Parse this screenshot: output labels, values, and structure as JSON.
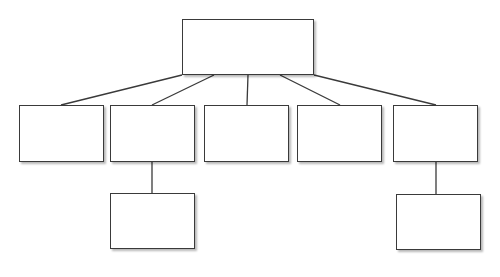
{
  "diagram": {
    "type": "org-chart",
    "colors": {
      "stroke": "#3a3a3a",
      "fill": "#ffffff",
      "background": "#ffffff"
    },
    "nodes": [
      {
        "id": "root",
        "label": "",
        "x": 182,
        "y": 19,
        "w": 132,
        "h": 56
      },
      {
        "id": "child-1",
        "label": "",
        "x": 19,
        "y": 105,
        "w": 85,
        "h": 57
      },
      {
        "id": "child-2",
        "label": "",
        "x": 110,
        "y": 105,
        "w": 85,
        "h": 57
      },
      {
        "id": "child-3",
        "label": "",
        "x": 204,
        "y": 105,
        "w": 85,
        "h": 57
      },
      {
        "id": "child-4",
        "label": "",
        "x": 297,
        "y": 105,
        "w": 85,
        "h": 57
      },
      {
        "id": "child-5",
        "label": "",
        "x": 393,
        "y": 105,
        "w": 85,
        "h": 57
      },
      {
        "id": "grandchild-2",
        "label": "",
        "x": 110,
        "y": 193,
        "w": 85,
        "h": 56
      },
      {
        "id": "grandchild-5",
        "label": "",
        "x": 396,
        "y": 194,
        "w": 85,
        "h": 56
      }
    ],
    "edges": [
      {
        "from": "root",
        "to": "child-1",
        "x1": 182,
        "y1": 75,
        "x2": 61,
        "y2": 105
      },
      {
        "from": "root",
        "to": "child-2",
        "x1": 214,
        "y1": 75,
        "x2": 152,
        "y2": 105
      },
      {
        "from": "root",
        "to": "child-3",
        "x1": 248,
        "y1": 75,
        "x2": 247,
        "y2": 105
      },
      {
        "from": "root",
        "to": "child-4",
        "x1": 280,
        "y1": 75,
        "x2": 340,
        "y2": 105
      },
      {
        "from": "root",
        "to": "child-5",
        "x1": 314,
        "y1": 75,
        "x2": 436,
        "y2": 105
      },
      {
        "from": "child-2",
        "to": "grandchild-2",
        "x1": 152,
        "y1": 162,
        "x2": 152,
        "y2": 193
      },
      {
        "from": "child-5",
        "to": "grandchild-5",
        "x1": 436,
        "y1": 162,
        "x2": 436,
        "y2": 194
      }
    ]
  }
}
